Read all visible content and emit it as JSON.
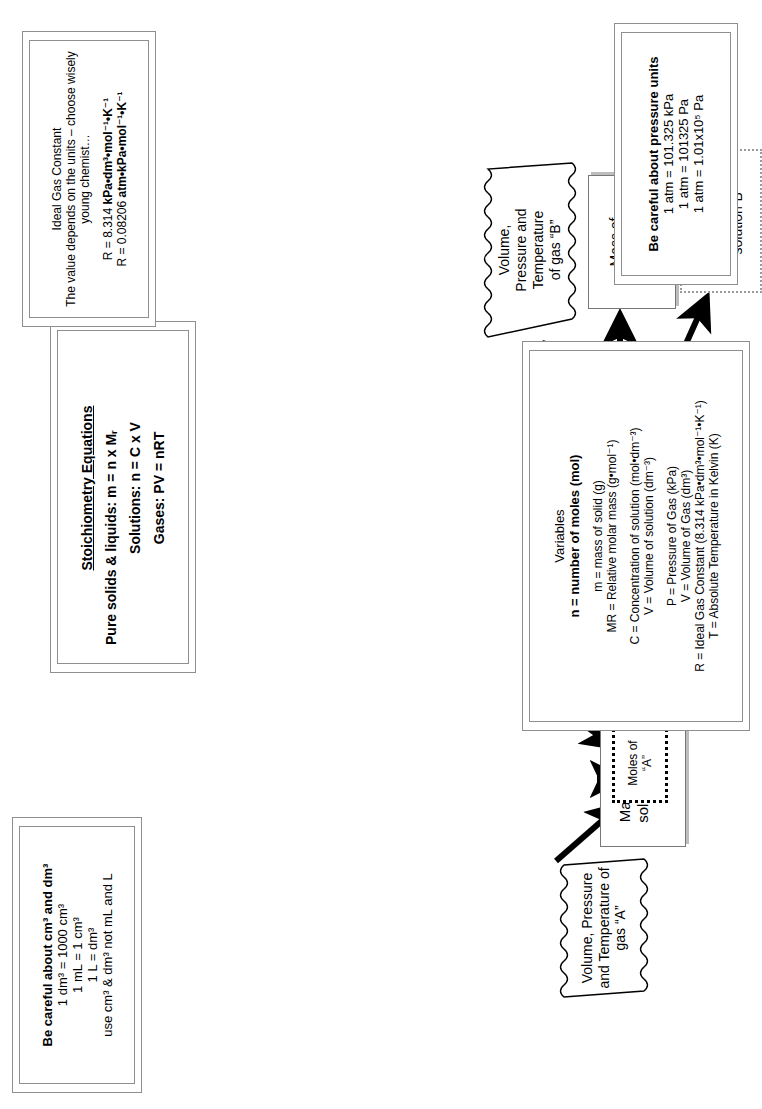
{
  "flow": {
    "gas_a": {
      "label": "Volume, Pressure\nand Temperature of\ngas “A”"
    },
    "mass_a": {
      "line1": "Mass of pure",
      "line2": "solid or liquid",
      "line3": "“A”"
    },
    "solution_a": {
      "line1": "Concentration",
      "line2": "and Volume of",
      "line3": "solution “A”"
    },
    "moles_a": {
      "line1": "Moles of",
      "line2": "“A”"
    },
    "mole_ratio": {
      "line1": "Mole Ratio from balancing",
      "line2": "coefficients"
    },
    "moles_b": {
      "line1": "Moles of",
      "line2": "“B”"
    },
    "gas_b": {
      "label": "Volume,\nPressure and\nTemperature\nof gas “B”"
    },
    "mass_b": {
      "line1": "Mass of",
      "line2": "pure solid or",
      "line3": "liquid“B”"
    },
    "solution_b": {
      "line1": "Concentration",
      "line2": "and Volume of",
      "line3": "solution“B”"
    }
  },
  "panels": {
    "volume_units": {
      "title": "Be careful about cm³ and dm³",
      "lines": [
        "1 dm³ = 1000 cm³",
        "1 mL = 1 cm³",
        "1 L = dm³",
        "use cm³ & dm³  not mL and L"
      ]
    },
    "equations": {
      "title": "Stoichiometry Equations",
      "lines": [
        "Pure solids & liquids:  m = n x Mᵣ",
        "Solutions:  n = C x V",
        "Gases:  PV = nRT"
      ]
    },
    "variables": {
      "title": "Variables",
      "headline": "n = number of moles (mol)",
      "group1": [
        "m = mass of solid (g)",
        "MR = Relative molar mass (g•mol⁻¹)"
      ],
      "group2": [
        "C = Concentration of solution (mol•dm⁻³)",
        "V = Volume of solution (dm⁻³)"
      ],
      "group3": [
        "P = Pressure of Gas (kPa)",
        "V = Volume of Gas (dm³)",
        "R = Ideal Gas Constant (8.314 kPa•dm³•mol⁻¹•K⁻¹)",
        "T = Absolute Temperature in Kelvin (K)"
      ]
    },
    "gas_constant": {
      "title": "Ideal Gas Constant",
      "lines": [
        "The value depends on the units – choose wisely",
        "young chemist…"
      ],
      "values": [
        {
          "prefix": "R = 8.314 ",
          "bold": "kPa•dm³•mol⁻¹•K⁻¹",
          "suffix": ""
        },
        {
          "prefix": "R = 0.08206 ",
          "bold": "atm•kPa•mol⁻¹•K⁻¹",
          "suffix": ""
        }
      ]
    },
    "pressure_units": {
      "title": "Be careful about pressure units",
      "lines": [
        "1 atm = 101.325 kPa",
        "1 atm = 101325 Pa",
        "1 atm = 1.01x10⁵ Pa"
      ]
    }
  },
  "colors": {
    "ink": "#000000",
    "panel_border": "#8f8f8f",
    "shadow": "#bdbdbd",
    "page": "#ffffff"
  }
}
